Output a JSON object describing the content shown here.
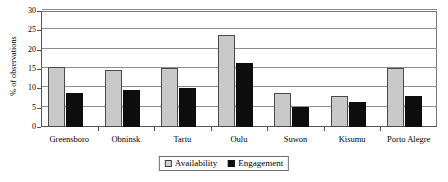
{
  "chart_data": {
    "type": "bar",
    "title": "",
    "subtitle": "",
    "xlabel": "",
    "ylabel": "% of observations",
    "ylim": [
      0,
      30
    ],
    "ytick_values": [
      0,
      5,
      10,
      15,
      20,
      25,
      30
    ],
    "ytick_labels": [
      "0",
      "5",
      "10",
      "15",
      "20",
      "25",
      "30"
    ],
    "grid": true,
    "legend_position": "bottom-center",
    "categories": [
      "Greensboro",
      "Obninsk",
      "Tartu",
      "Oulu",
      "Suwon",
      "Kisumu",
      "Porto Alegre"
    ],
    "series": [
      {
        "name": "Availability",
        "color": "#c9c9c9",
        "values": [
          15.5,
          14.8,
          15.3,
          23.9,
          8.7,
          8.1,
          15.2
        ]
      },
      {
        "name": "Engagement",
        "color": "#0d0d0d",
        "values": [
          8.7,
          9.7,
          10.2,
          16.5,
          5.3,
          6.5,
          8.0
        ]
      }
    ]
  }
}
